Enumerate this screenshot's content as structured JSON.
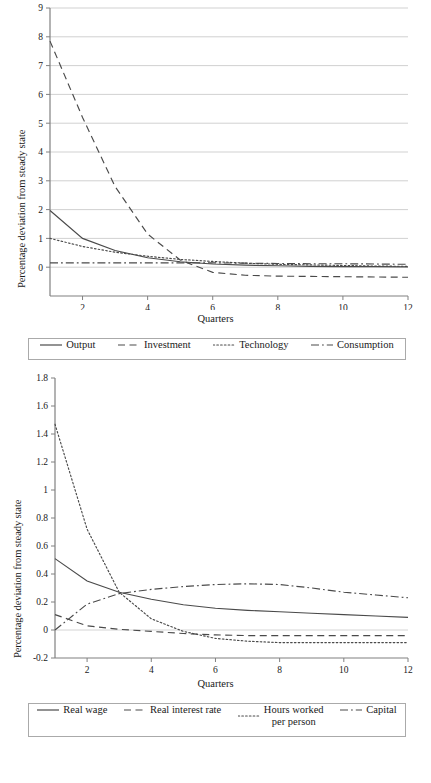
{
  "figure": {
    "charts": [
      {
        "id": "top",
        "ylabel": "Percentage deviation from steady state",
        "xlabel": "Quarters",
        "yticks": [
          "0",
          "1",
          "2",
          "3",
          "4",
          "5",
          "6",
          "7",
          "8",
          "9"
        ],
        "xticks": [
          "2",
          "4",
          "6",
          "8",
          "10",
          "12"
        ],
        "legend": [
          {
            "label": "Output",
            "style": "solid"
          },
          {
            "label": "Investment",
            "style": "dashed"
          },
          {
            "label": "Technology",
            "style": "dotted"
          },
          {
            "label": "Consumption",
            "style": "dashdot"
          }
        ]
      },
      {
        "id": "bottom",
        "ylabel": "Percentage deviation from steady state",
        "xlabel": "Quarters",
        "yticks": [
          "-0.2",
          "0",
          "0.2",
          "0.4",
          "0.6",
          "0.8",
          "1",
          "1.2",
          "1.4",
          "1.6",
          "1.8"
        ],
        "xticks": [
          "2",
          "4",
          "6",
          "8",
          "10",
          "12"
        ],
        "legend": [
          {
            "label": "Real wage",
            "style": "solid"
          },
          {
            "label": "Real interest rate",
            "style": "dashed"
          },
          {
            "label": "Hours worked\nper person",
            "style": "dotted"
          },
          {
            "label": "Capital",
            "style": "dashdot"
          }
        ]
      }
    ]
  },
  "chart_data": [
    {
      "type": "line",
      "title": "",
      "xlabel": "Quarters",
      "ylabel": "Percentage deviation from steady state",
      "xlim": [
        1,
        12
      ],
      "ylim": [
        -1,
        9
      ],
      "xticks": [
        2,
        4,
        6,
        8,
        10,
        12
      ],
      "yticks": [
        0,
        1,
        2,
        3,
        4,
        5,
        6,
        7,
        8,
        9
      ],
      "grid": "horizontal",
      "legend_position": "below",
      "x": [
        1,
        2,
        3,
        4,
        5,
        6,
        7,
        8,
        9,
        10,
        11,
        12
      ],
      "series": [
        {
          "name": "Output",
          "style": "solid",
          "values": [
            1.97,
            1.0,
            0.58,
            0.33,
            0.19,
            0.11,
            0.07,
            0.05,
            0.03,
            0.02,
            0.02,
            0.01
          ]
        },
        {
          "name": "Investment",
          "style": "dashed",
          "values": [
            7.85,
            5.2,
            2.8,
            1.15,
            0.25,
            -0.18,
            -0.28,
            -0.31,
            -0.32,
            -0.33,
            -0.34,
            -0.35
          ]
        },
        {
          "name": "Technology",
          "style": "dotted",
          "values": [
            1.0,
            0.72,
            0.52,
            0.38,
            0.27,
            0.2,
            0.14,
            0.1,
            0.08,
            0.06,
            0.04,
            0.03
          ]
        },
        {
          "name": "Consumption",
          "style": "dashdot",
          "values": [
            0.15,
            0.15,
            0.15,
            0.15,
            0.15,
            0.15,
            0.14,
            0.13,
            0.12,
            0.12,
            0.11,
            0.1
          ]
        }
      ]
    },
    {
      "type": "line",
      "title": "",
      "xlabel": "Quarters",
      "ylabel": "Percentage deviation from steady state",
      "xlim": [
        1,
        12
      ],
      "ylim": [
        -0.2,
        1.8
      ],
      "xticks": [
        2,
        4,
        6,
        8,
        10,
        12
      ],
      "yticks": [
        -0.2,
        0,
        0.2,
        0.4,
        0.6,
        0.8,
        1.0,
        1.2,
        1.4,
        1.6,
        1.8
      ],
      "grid": "none",
      "legend_position": "below",
      "x": [
        1,
        2,
        3,
        4,
        5,
        6,
        7,
        8,
        9,
        10,
        11,
        12
      ],
      "series": [
        {
          "name": "Real wage",
          "style": "solid",
          "values": [
            0.51,
            0.35,
            0.27,
            0.22,
            0.18,
            0.155,
            0.14,
            0.13,
            0.12,
            0.11,
            0.1,
            0.09
          ]
        },
        {
          "name": "Real interest rate",
          "style": "dashed",
          "values": [
            0.11,
            0.03,
            0.005,
            -0.01,
            -0.025,
            -0.035,
            -0.04,
            -0.04,
            -0.04,
            -0.04,
            -0.04,
            -0.04
          ]
        },
        {
          "name": "Hours worked per person",
          "style": "dotted",
          "values": [
            1.47,
            0.72,
            0.27,
            0.08,
            -0.01,
            -0.06,
            -0.08,
            -0.09,
            -0.09,
            -0.09,
            -0.09,
            -0.09
          ]
        },
        {
          "name": "Capital",
          "style": "dashdot",
          "values": [
            0.0,
            0.185,
            0.26,
            0.29,
            0.31,
            0.325,
            0.33,
            0.325,
            0.3,
            0.27,
            0.25,
            0.23
          ]
        }
      ]
    }
  ]
}
